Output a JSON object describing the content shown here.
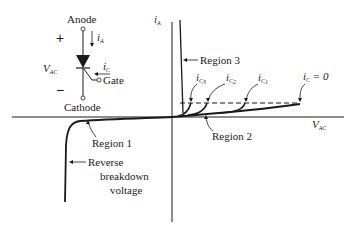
{
  "scr": {
    "anode": "Anode",
    "cathode": "Cathode",
    "gate": "Gate",
    "plus": "+",
    "minus": "−",
    "v_ac": "V",
    "v_ac_sub": "AC",
    "i_a": "i",
    "i_a_sub": "A",
    "i_c": "i",
    "i_c_sub": "C"
  },
  "plot": {
    "y_axis_label": "i",
    "y_axis_sub": "A",
    "x_axis_label": "V",
    "x_axis_sub": "AC",
    "region1": "Region  1",
    "region2": "Region  2",
    "region3": "Region  3",
    "reverse_l1": "Reverse",
    "reverse_l2": "breakdown",
    "reverse_l3": "voltage",
    "curves": [
      {
        "label": "i",
        "sub": "C",
        "subsub": "3"
      },
      {
        "label": "i",
        "sub": "C",
        "subsub": "2"
      },
      {
        "label": "i",
        "sub": "C",
        "subsub": "1"
      },
      {
        "label": "i",
        "sub": "C",
        "suffix": " = 0"
      }
    ]
  },
  "colors": {
    "ink": "#1a1a1a",
    "background": "#ffffff"
  }
}
